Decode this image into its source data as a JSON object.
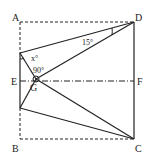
{
  "figure": {
    "points": {
      "A": "A",
      "B": "B",
      "C": "C",
      "D": "D",
      "E": "E",
      "F": "F",
      "G": "G"
    },
    "angles": {
      "x": "x°",
      "right": "90°",
      "fifteen": "15°"
    }
  }
}
